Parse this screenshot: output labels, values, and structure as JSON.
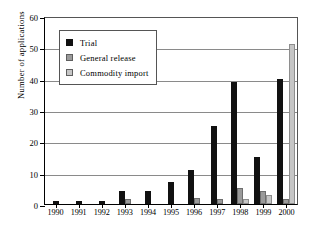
{
  "chart_data": {
    "type": "bar",
    "title": "",
    "xlabel": "",
    "ylabel": "Number of applications",
    "ylim": [
      0,
      60
    ],
    "ytick_step": 10,
    "yticks": [
      0,
      10,
      20,
      30,
      40,
      50,
      60
    ],
    "ytick_labels": [
      "0",
      "10",
      "20",
      "30",
      "40",
      "50",
      "60"
    ],
    "grid": true,
    "grid_axis": "y",
    "legend_position": "upper-left-inside",
    "categories": [
      "1990",
      "1991",
      "1992",
      "1993",
      "1994",
      "1995",
      "1996",
      "1997",
      "1998",
      "1999",
      "2000"
    ],
    "series": [
      {
        "name": "Trial",
        "color": "#111111",
        "values": [
          1,
          1,
          1,
          4,
          4,
          7,
          11,
          25,
          39,
          15,
          40
        ]
      },
      {
        "name": "General release",
        "color": "#9a9a9a",
        "values": [
          0,
          0,
          0,
          1.5,
          0,
          0,
          2,
          1.5,
          5,
          4,
          1.5
        ]
      },
      {
        "name": "Commodity import",
        "color": "#c6c6c6",
        "values": [
          0,
          0,
          0,
          0,
          0,
          0,
          0,
          0,
          1.5,
          3,
          51
        ]
      }
    ],
    "legend": [
      "Trial",
      "General release",
      "Commodity import"
    ]
  },
  "colors": {
    "trial": "#111111",
    "general_release": "#9a9a9a",
    "commodity_import": "#c6c6c6",
    "axis": "#000000",
    "gridline": "#8a8a8a",
    "background": "#ffffff"
  }
}
